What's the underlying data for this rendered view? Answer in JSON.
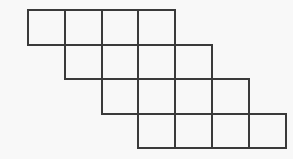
{
  "figure": {
    "name": "staircase-grid-figure",
    "background_color": "#f8f8f8",
    "line_color": "#3a3a3a",
    "line_width": 2,
    "canvas": {
      "width": 293,
      "height": 159
    },
    "geometry": {
      "cell_width": 36.8,
      "cell_height": 34.5,
      "origin_x": 28,
      "origin_y": 10,
      "rows": 4,
      "cells_per_row": 4,
      "row_step_x": 36.8,
      "row_step_y": 34.5
    },
    "rows": [
      {
        "index": 1,
        "label": "row-1",
        "x_start": 28,
        "x_end": 175.2,
        "y_top": 10,
        "y_bottom": 44.5,
        "cell_count": 4,
        "cells": [
          {
            "label": "r1c1",
            "x": 28,
            "y": 10,
            "w": 36.8,
            "h": 34.5
          },
          {
            "label": "r1c2",
            "x": 64.8,
            "y": 10,
            "w": 36.8,
            "h": 34.5
          },
          {
            "label": "r1c3",
            "x": 101.6,
            "y": 10,
            "w": 36.8,
            "h": 34.5
          },
          {
            "label": "r1c4",
            "x": 138.4,
            "y": 10,
            "w": 36.8,
            "h": 34.5
          }
        ]
      },
      {
        "index": 2,
        "label": "row-2",
        "x_start": 64.8,
        "x_end": 212,
        "y_top": 44.5,
        "y_bottom": 79,
        "cell_count": 4,
        "cells": [
          {
            "label": "r2c1",
            "x": 64.8,
            "y": 44.5,
            "w": 36.8,
            "h": 34.5
          },
          {
            "label": "r2c2",
            "x": 101.6,
            "y": 44.5,
            "w": 36.8,
            "h": 34.5
          },
          {
            "label": "r2c3",
            "x": 138.4,
            "y": 44.5,
            "w": 36.8,
            "h": 34.5
          },
          {
            "label": "r2c4",
            "x": 175.2,
            "y": 44.5,
            "w": 36.8,
            "h": 34.5
          }
        ]
      },
      {
        "index": 3,
        "label": "row-3",
        "x_start": 101.6,
        "x_end": 248.8,
        "y_top": 79,
        "y_bottom": 113.5,
        "cell_count": 4,
        "cells": [
          {
            "label": "r3c1",
            "x": 101.6,
            "y": 79,
            "w": 36.8,
            "h": 34.5
          },
          {
            "label": "r3c2",
            "x": 138.4,
            "y": 79,
            "w": 36.8,
            "h": 34.5
          },
          {
            "label": "r3c3",
            "x": 175.2,
            "y": 79,
            "w": 36.8,
            "h": 34.5
          },
          {
            "label": "r3c4",
            "x": 212,
            "y": 79,
            "w": 36.8,
            "h": 34.5
          }
        ]
      },
      {
        "index": 4,
        "label": "row-4",
        "x_start": 138.4,
        "x_end": 285.6,
        "y_top": 113.5,
        "y_bottom": 148,
        "cell_count": 4,
        "cells": [
          {
            "label": "r4c1",
            "x": 138.4,
            "y": 113.5,
            "w": 36.8,
            "h": 34.5
          },
          {
            "label": "r4c2",
            "x": 175.2,
            "y": 113.5,
            "w": 36.8,
            "h": 34.5
          },
          {
            "label": "r4c3",
            "x": 212,
            "y": 113.5,
            "w": 36.8,
            "h": 34.5
          },
          {
            "label": "r4c4",
            "x": 248.8,
            "y": 113.5,
            "w": 36.8,
            "h": 34.5
          }
        ]
      }
    ],
    "total_cells": 16
  }
}
